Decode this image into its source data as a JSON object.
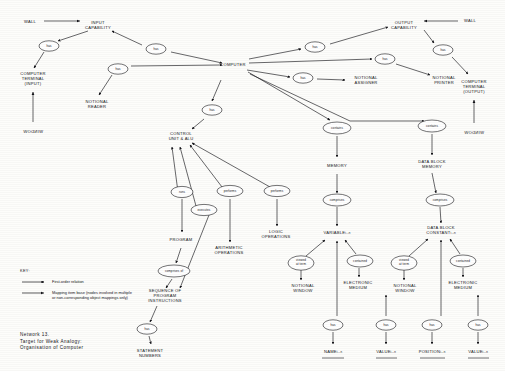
{
  "diagram": {
    "caption": "Network 13.\nTarget for Weak Analogy:\nOrganisation of Computer",
    "key_heading": "KEY:",
    "key_items": [
      {
        "marker": "single-arrow",
        "text": "First-order relation"
      },
      {
        "marker": "double-arrow",
        "text": "Mapping item base (nodes involved in multiple\nor non-corresponding object mappings only)"
      }
    ],
    "nodes": [
      {
        "id": "wall-left",
        "label": "WALL",
        "x": 30,
        "y": 22
      },
      {
        "id": "input-capability",
        "label": "INPUT\nCAPABILITY",
        "x": 98,
        "y": 25
      },
      {
        "id": "computer-terminal-in",
        "label": "COMPUTER\nTERMINAL\n(INPUT)",
        "x": 33,
        "y": 79
      },
      {
        "id": "window-left",
        "label": "WINDOW",
        "x": 33,
        "y": 131,
        "mirrored": true
      },
      {
        "id": "notional-reader",
        "label": "NOTIONAL\nREADER",
        "x": 97,
        "y": 104
      },
      {
        "id": "computer",
        "label": "COMPUTER",
        "x": 233,
        "y": 65
      },
      {
        "id": "notional-assigner",
        "label": "NOTIONAL\nASSIGNER",
        "x": 366,
        "y": 80
      },
      {
        "id": "notional-printer",
        "label": "NOTIONAL\nPRINTER",
        "x": 444,
        "y": 80
      },
      {
        "id": "output-capability",
        "label": "OUTPUT\nCAPABILITY",
        "x": 404,
        "y": 25
      },
      {
        "id": "wall-right",
        "label": "WALL",
        "x": 470,
        "y": 21
      },
      {
        "id": "computer-terminal-out",
        "label": "COMPUTER\nTERMINAL\n(OUTPUT)",
        "x": 474,
        "y": 87
      },
      {
        "id": "window-right",
        "label": "WINDOW",
        "x": 474,
        "y": 132,
        "mirrored": true
      },
      {
        "id": "control-unit-alu",
        "label": "CONTROL\nUNIT & ALU",
        "x": 181,
        "y": 136
      },
      {
        "id": "memory",
        "label": "MEMORY",
        "x": 337,
        "y": 166
      },
      {
        "id": "data-block-memory",
        "label": "DATA BLOCK\nMEMORY",
        "x": 432,
        "y": 164
      },
      {
        "id": "program",
        "label": "PROGRAM",
        "x": 181,
        "y": 240
      },
      {
        "id": "arithmetic-operations",
        "label": "ARITHMETIC\nOPERATIONS",
        "x": 229,
        "y": 250
      },
      {
        "id": "logic-operations",
        "label": "LOGIC\nOPERATIONS",
        "x": 276,
        "y": 234
      },
      {
        "id": "sequence-instructions",
        "label": "SEQUENCE OF\nPROGRAM\nINSTRUCTIONS",
        "x": 165,
        "y": 296
      },
      {
        "id": "statement-numbers",
        "label": "STATEMENT\nNUMBERS",
        "x": 150,
        "y": 353
      },
      {
        "id": "variable",
        "label": "VARIABLE",
        "subscript": "i…n",
        "x": 337,
        "y": 233
      },
      {
        "id": "data-block-constant",
        "label": "DATA BLOCK\nCONSTANT",
        "subscript": "i…n",
        "x": 441,
        "y": 231
      },
      {
        "id": "notional-window-1",
        "label": "NOTIONAL\nWINDOW",
        "x": 303,
        "y": 288
      },
      {
        "id": "electronic-medium-1",
        "label": "ELECTRONIC\nMEDIUM",
        "x": 358,
        "y": 285
      },
      {
        "id": "notional-window-2",
        "label": "NOTIONAL\nWINDOW",
        "x": 405,
        "y": 288
      },
      {
        "id": "electronic-medium-2",
        "label": "ELECTRONIC\nMEDIUM",
        "x": 463,
        "y": 285
      },
      {
        "id": "name",
        "label": "NAME",
        "subscript": "i…n",
        "x": 333,
        "y": 352
      },
      {
        "id": "value-1",
        "label": "VALUE",
        "subscript": "i…n",
        "x": 386,
        "y": 352
      },
      {
        "id": "position",
        "label": "POSITION",
        "subscript": "i…n",
        "x": 432,
        "y": 352
      },
      {
        "id": "value-2",
        "label": "VALUE",
        "subscript": "i…n",
        "x": 478,
        "y": 352
      }
    ],
    "relations": [
      {
        "id": "rel-has-input-terminal",
        "label": "has",
        "x": 49,
        "y": 46
      },
      {
        "id": "rel-has-reader",
        "label": "has",
        "x": 118,
        "y": 69
      },
      {
        "id": "rel-has-input-cap",
        "label": "has",
        "x": 156,
        "y": 49
      },
      {
        "id": "rel-has-control-unit",
        "label": "has",
        "x": 212,
        "y": 110
      },
      {
        "id": "rel-has-assigner",
        "label": "has",
        "x": 303,
        "y": 78
      },
      {
        "id": "rel-has-printer",
        "label": "has",
        "x": 385,
        "y": 59
      },
      {
        "id": "rel-has-output-cap",
        "label": "has",
        "x": 315,
        "y": 47
      },
      {
        "id": "rel-has-output-terminal",
        "label": "has",
        "x": 443,
        "y": 50
      },
      {
        "id": "rel-contains-memory",
        "label": "contains",
        "x": 337,
        "y": 128
      },
      {
        "id": "rel-contains-datablock",
        "label": "contains",
        "x": 432,
        "y": 126
      },
      {
        "id": "rel-runs-program",
        "label": "runs",
        "x": 182,
        "y": 192
      },
      {
        "id": "rel-executes",
        "label": "executes",
        "x": 204,
        "y": 210
      },
      {
        "id": "rel-performs-arith",
        "label": "performs",
        "x": 230,
        "y": 191
      },
      {
        "id": "rel-performs-logic",
        "label": "performs",
        "x": 277,
        "y": 191
      },
      {
        "id": "rel-comprises-of",
        "label": "comprises of",
        "x": 174,
        "y": 271
      },
      {
        "id": "rel-has-statement-nos",
        "label": "has",
        "x": 147,
        "y": 329
      },
      {
        "id": "rel-comprises-variable",
        "label": "comprises",
        "x": 337,
        "y": 200
      },
      {
        "id": "rel-comprises-constant",
        "label": "comprises",
        "x": 440,
        "y": 200
      },
      {
        "id": "rel-viewed-at-term-1",
        "label": "viewed\nat term",
        "x": 301,
        "y": 263
      },
      {
        "id": "rel-contained-1",
        "label": "contained",
        "x": 360,
        "y": 261
      },
      {
        "id": "rel-viewed-at-term-2",
        "label": "viewed\nat term",
        "x": 404,
        "y": 263
      },
      {
        "id": "rel-contained-2",
        "label": "contained",
        "x": 463,
        "y": 261
      },
      {
        "id": "rel-has-name",
        "label": "has",
        "x": 333,
        "y": 325
      },
      {
        "id": "rel-has-value-1",
        "label": "has",
        "x": 386,
        "y": 325
      },
      {
        "id": "rel-has-position",
        "label": "has",
        "x": 432,
        "y": 325
      },
      {
        "id": "rel-has-value-2",
        "label": "has",
        "x": 478,
        "y": 325
      }
    ],
    "colors": {
      "ink": "#15151a",
      "paper": "#fdfdfb"
    }
  }
}
